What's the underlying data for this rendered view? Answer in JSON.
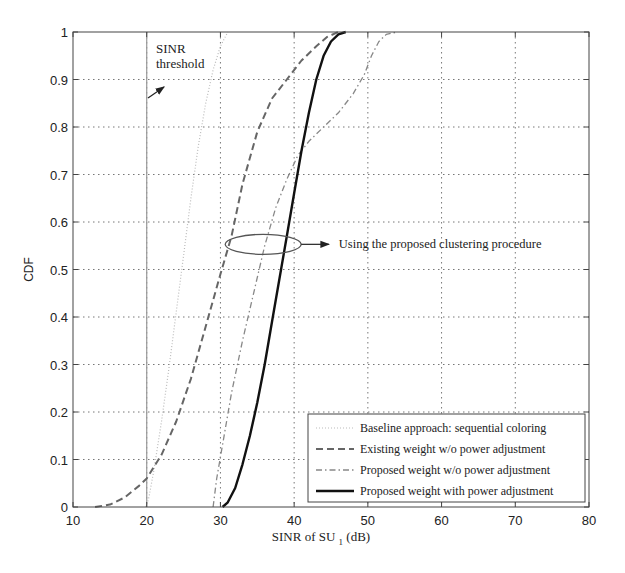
{
  "chart_data": {
    "type": "line",
    "title": "",
    "xlabel": "SINR of SU",
    "xlabel_sub": "1",
    "xlabel_unit": "(dB)",
    "ylabel": "CDF",
    "xlim": [
      10,
      80
    ],
    "ylim": [
      0,
      1
    ],
    "xticks": [
      10,
      20,
      30,
      40,
      50,
      60,
      70,
      80
    ],
    "yticks": [
      0,
      0.1,
      0.2,
      0.3,
      0.4,
      0.5,
      0.6,
      0.7,
      0.8,
      0.9,
      1
    ],
    "xtick_labels": [
      "10",
      "20",
      "30",
      "40",
      "50",
      "60",
      "70",
      "80"
    ],
    "ytick_labels": [
      "0",
      "0.1",
      "0.2",
      "0.3",
      "0.4",
      "0.5",
      "0.6",
      "0.7",
      "0.8",
      "0.9",
      "1"
    ],
    "grid": true,
    "legend_position": "lower right",
    "series": [
      {
        "name": "Baseline approach: sequential coloring",
        "style": "dotted",
        "color": "#bbbbbb",
        "x": [
          19.9,
          20.3,
          21.0,
          22.0,
          23.0,
          24.0,
          25.0,
          26.0,
          27.0,
          28.0,
          29.0,
          30.0,
          31.0
        ],
        "y": [
          0.0,
          0.02,
          0.08,
          0.18,
          0.29,
          0.41,
          0.53,
          0.65,
          0.76,
          0.85,
          0.92,
          0.97,
          1.0
        ]
      },
      {
        "name": "Existing weight w/o power adjustment",
        "style": "dashed",
        "color": "#666666",
        "x": [
          13,
          15,
          17,
          19,
          20,
          22,
          24,
          26,
          28,
          30,
          31.5,
          33,
          35,
          37,
          39,
          41,
          43,
          44.5,
          46
        ],
        "y": [
          0.0,
          0.005,
          0.02,
          0.045,
          0.06,
          0.11,
          0.18,
          0.27,
          0.38,
          0.49,
          0.57,
          0.68,
          0.79,
          0.86,
          0.9,
          0.94,
          0.97,
          0.99,
          1.0
        ]
      },
      {
        "name": "Proposed weight w/o power adjustment",
        "style": "dashdot",
        "color": "#888888",
        "x": [
          29.0,
          29.5,
          30.5,
          31.5,
          33,
          34.5,
          36,
          37.5,
          39,
          40.5,
          42,
          44,
          46,
          48,
          49.5,
          50.5,
          51.5,
          52.5,
          54
        ],
        "y": [
          0.0,
          0.06,
          0.15,
          0.24,
          0.35,
          0.45,
          0.55,
          0.63,
          0.69,
          0.74,
          0.77,
          0.8,
          0.83,
          0.87,
          0.91,
          0.95,
          0.98,
          0.995,
          1.0
        ]
      },
      {
        "name": "Proposed weight with power adjustment",
        "style": "solid",
        "color": "#111111",
        "x": [
          30.3,
          31.0,
          32.0,
          33.0,
          34.0,
          35.0,
          36.0,
          37.0,
          38.0,
          39.0,
          40.0,
          41.0,
          42.0,
          43.0,
          44.0,
          45.0,
          46.0,
          47.0
        ],
        "y": [
          0.0,
          0.01,
          0.04,
          0.09,
          0.15,
          0.22,
          0.3,
          0.39,
          0.48,
          0.57,
          0.66,
          0.75,
          0.83,
          0.9,
          0.95,
          0.98,
          0.995,
          1.0
        ]
      }
    ],
    "annotations": [
      {
        "text_line1": "SINR",
        "text_line2": "threshold",
        "x": 20,
        "arrow": "from (20.3, 0.86) to (22.3, 0.9)"
      },
      {
        "text": "Using the proposed clustering procedure",
        "ellipse_center": [
          35.8,
          0.553
        ],
        "arrow_to": [
          44.7,
          0.553
        ]
      }
    ],
    "threshold_line_x": 20
  }
}
